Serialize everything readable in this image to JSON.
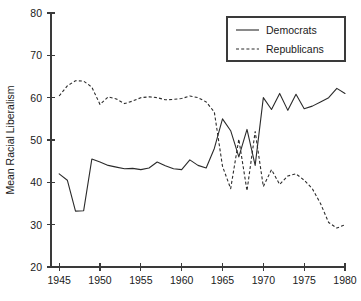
{
  "chart_data": {
    "type": "line",
    "title": "",
    "xlabel": "",
    "ylabel": "Mean Racial Liberalism",
    "xlim": [
      1944,
      1980
    ],
    "ylim": [
      20,
      80
    ],
    "xticks": [
      1945,
      1950,
      1955,
      1960,
      1965,
      1970,
      1975,
      1980
    ],
    "xtick_labels": [
      "1945",
      "1950",
      "1955",
      "1960",
      "1965",
      "1970",
      "1975",
      "1980"
    ],
    "yticks": [
      20,
      30,
      40,
      50,
      60,
      70,
      80
    ],
    "ytick_labels": [
      "20",
      "30",
      "40",
      "50",
      "60",
      "70",
      "80"
    ],
    "grid": false,
    "legend_position": "top-right",
    "x": [
      1945,
      1946,
      1947,
      1948,
      1949,
      1950,
      1951,
      1952,
      1953,
      1954,
      1955,
      1956,
      1957,
      1958,
      1959,
      1960,
      1961,
      1962,
      1963,
      1964,
      1965,
      1966,
      1967,
      1968,
      1969,
      1970,
      1971,
      1972,
      1973,
      1974,
      1975,
      1976,
      1977,
      1978,
      1979,
      1980
    ],
    "series": [
      {
        "name": "Democrats",
        "style": "solid",
        "color": "#2b2b2b",
        "values": [
          42.0,
          40.5,
          33.2,
          33.3,
          45.5,
          44.8,
          44.0,
          43.6,
          43.2,
          43.3,
          43.0,
          43.4,
          44.8,
          43.9,
          43.2,
          43.0,
          45.3,
          44.0,
          43.4,
          48.0,
          55.0,
          52.2,
          46.0,
          52.5,
          44.0,
          60.0,
          57.2,
          61.0,
          57.0,
          60.8,
          57.4,
          58.0,
          59.0,
          60.0,
          62.2,
          61.0
        ]
      },
      {
        "name": "Republicans",
        "style": "dashed",
        "color": "#2b2b2b",
        "values": [
          60.4,
          62.8,
          64.0,
          63.9,
          62.5,
          58.4,
          60.2,
          59.7,
          58.6,
          59.2,
          60.0,
          60.2,
          60.0,
          59.5,
          59.6,
          59.8,
          60.4,
          60.0,
          59.0,
          56.6,
          43.8,
          38.5,
          50.2,
          38.0,
          52.0,
          39.0,
          43.0,
          39.5,
          41.5,
          42.0,
          40.5,
          38.5,
          35.0,
          30.5,
          29.2,
          30.0
        ]
      }
    ]
  },
  "legend": {
    "entries": [
      {
        "label": "Democrats",
        "style": "solid"
      },
      {
        "label": "Republicans",
        "style": "dashed"
      }
    ]
  }
}
